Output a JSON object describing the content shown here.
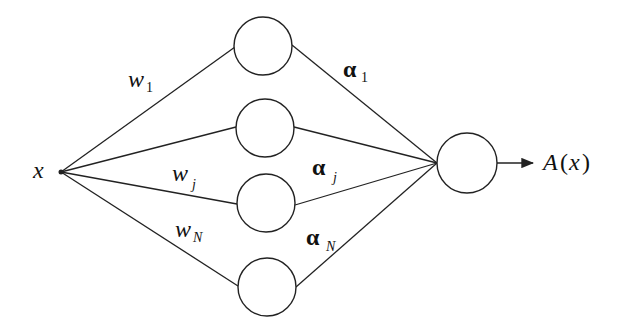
{
  "diagram": {
    "type": "single-hidden-layer network",
    "input": {
      "label": "x",
      "x": 61,
      "y": 172
    },
    "hidden_nodes": [
      {
        "id": "node-1",
        "cx": 263,
        "cy": 46
      },
      {
        "id": "node-2",
        "cx": 265,
        "cy": 128
      },
      {
        "id": "node-j",
        "cx": 266,
        "cy": 203
      },
      {
        "id": "node-N",
        "cx": 267,
        "cy": 287
      }
    ],
    "hidden_radius": 29,
    "output_node": {
      "cx": 467,
      "cy": 163,
      "r": 30
    },
    "output_label": {
      "text": "A(x)",
      "main": "A",
      "paren_open": "(",
      "var": "x",
      "paren_close": ")"
    },
    "input_weights": [
      {
        "base": "w",
        "sub": "1"
      },
      {
        "base": "w",
        "sub": "j"
      },
      {
        "base": "w",
        "sub": "N"
      }
    ],
    "output_weights": [
      {
        "base": "α",
        "sub": "1"
      },
      {
        "base": "α",
        "sub": "j"
      },
      {
        "base": "α",
        "sub": "N"
      }
    ],
    "colors": {
      "stroke": "#222222",
      "background": "#ffffff"
    }
  }
}
